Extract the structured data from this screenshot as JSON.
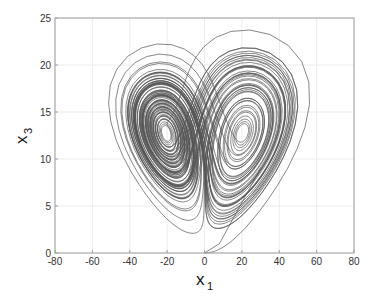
{
  "chart_data": {
    "type": "line",
    "title": "",
    "xlabel": "x",
    "xlabel_subscript": "1",
    "ylabel": "x",
    "ylabel_subscript": "3",
    "xlim": [
      -80,
      80
    ],
    "ylim": [
      0,
      25
    ],
    "xticks": [
      -80,
      -60,
      -40,
      -20,
      0,
      20,
      40,
      60,
      80
    ],
    "yticks": [
      0,
      5,
      10,
      15,
      20,
      25
    ],
    "xtick_labels": [
      "-80",
      "-60",
      "-40",
      "-20",
      "0",
      "20",
      "40",
      "60",
      "80"
    ],
    "ytick_labels": [
      "0",
      "5",
      "10",
      "15",
      "20",
      "25"
    ],
    "grid": true,
    "legend": null,
    "series": [
      {
        "name": "trajectory",
        "description": "Butterfly-shaped chaotic attractor projected on the x1-x3 plane; starts near (0,0), spirals around two lobes",
        "color": "#555555",
        "key_points": {
          "start": [
            0,
            0
          ],
          "left_wing_tip": [
            -77,
            22
          ],
          "right_wing_tip": [
            72,
            22
          ],
          "center_hole": [
            0,
            12
          ],
          "left_lobe_extent_x": -38,
          "right_lobe_extent_x": 40,
          "lobe_bottom_y": 2
        }
      }
    ]
  },
  "colors": {
    "line": "#555555",
    "axis": "#a0a0a0",
    "grid": "#ececec",
    "background": "#ffffff"
  }
}
